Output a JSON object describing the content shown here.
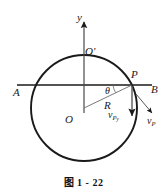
{
  "figure": {
    "caption": "图 1 - 22",
    "colors": {
      "stroke": "#1a1a1a",
      "background": "#ffffff"
    },
    "labels": {
      "y_axis": "y",
      "center_top": "O'",
      "left_end": "A",
      "right_end": "B",
      "point_on_circle": "P",
      "angle": "θ",
      "radius": "R",
      "velocity_y_main": "v",
      "velocity_y_sub": "P",
      "velocity_y_sub2": "y",
      "velocity_main": "v",
      "velocity_sub": "P",
      "circle_center": "O"
    },
    "geometry": {
      "circle_center_x": 84,
      "circle_center_y": 108,
      "circle_radius": 53,
      "chord_line_y": 85,
      "chord_line_x_start": 17,
      "chord_line_x_end": 152,
      "y_axis_x": 84,
      "y_axis_top": 20,
      "point_P_x": 132,
      "point_P_y": 85,
      "vy_arrow_end_y": 119,
      "vp_arrow_end_x": 152,
      "vp_arrow_end_y": 114
    }
  }
}
